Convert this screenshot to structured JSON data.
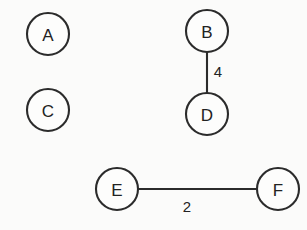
{
  "diagram": {
    "background_color": "#fbfbfa",
    "stroke_color": "#2b2b2b",
    "node_fill_color": "#fdfdfc",
    "label_color": "#222222",
    "node_radius": 21,
    "nodes": [
      {
        "id": "A",
        "label": "A",
        "cx": 48,
        "cy": 34,
        "r": 21
      },
      {
        "id": "B",
        "label": "B",
        "cx": 207,
        "cy": 31,
        "r": 21
      },
      {
        "id": "C",
        "label": "C",
        "cx": 48,
        "cy": 110,
        "r": 21
      },
      {
        "id": "D",
        "label": "D",
        "cx": 207,
        "cy": 114,
        "r": 21
      },
      {
        "id": "E",
        "label": "E",
        "cx": 117,
        "cy": 189,
        "r": 21
      },
      {
        "id": "F",
        "label": "F",
        "cx": 278,
        "cy": 189,
        "r": 21
      }
    ],
    "edges": [
      {
        "id": "edge-b-d",
        "source": "B",
        "target": "D",
        "weight": "4",
        "x1": 207,
        "y1": 52,
        "x2": 207,
        "y2": 93,
        "label_x": 218,
        "label_y": 71
      },
      {
        "id": "edge-e-f",
        "source": "E",
        "target": "F",
        "weight": "2",
        "x1": 138,
        "y1": 189,
        "x2": 257,
        "y2": 189,
        "label_x": 187,
        "label_y": 206
      }
    ]
  }
}
